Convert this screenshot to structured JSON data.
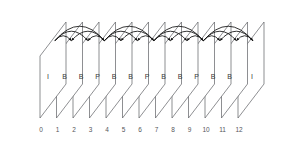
{
  "diagram": {
    "frame_count": 13,
    "frames": [
      {
        "index": "0",
        "type": "I"
      },
      {
        "index": "1",
        "type": "B"
      },
      {
        "index": "2",
        "type": "B"
      },
      {
        "index": "3",
        "type": "P"
      },
      {
        "index": "4",
        "type": "B"
      },
      {
        "index": "5",
        "type": "B"
      },
      {
        "index": "6",
        "type": "P"
      },
      {
        "index": "7",
        "type": "B"
      },
      {
        "index": "8",
        "type": "B"
      },
      {
        "index": "9",
        "type": "P"
      },
      {
        "index": "10",
        "type": "B"
      },
      {
        "index": "11",
        "type": "B"
      },
      {
        "index": "12",
        "type": "I"
      }
    ],
    "colors": {
      "plane_stroke": "#5d5f63",
      "arrow": "#101010",
      "frame_label": "#3a3a3a",
      "index_label": "#55565a",
      "background": "#ffffff"
    },
    "geometry": {
      "first_frame_x": 40,
      "frame_pitch": 16.5,
      "plane_width": 13,
      "plane_height": 62,
      "skew_x": 26,
      "skew_y": -34,
      "baseline_y": 118
    },
    "predictions": [
      {
        "from": "0",
        "to": "3",
        "tier": "tall",
        "direction": "forward"
      },
      {
        "from": "0",
        "to": "1",
        "tier": "low",
        "direction": "forward"
      },
      {
        "from": "0",
        "to": "2",
        "tier": "medium",
        "direction": "forward"
      },
      {
        "from": "3",
        "to": "2",
        "tier": "low",
        "direction": "backward"
      },
      {
        "from": "3",
        "to": "1",
        "tier": "medium",
        "direction": "backward"
      },
      {
        "from": "3",
        "to": "6",
        "tier": "tall",
        "direction": "forward"
      },
      {
        "from": "3",
        "to": "4",
        "tier": "low",
        "direction": "forward"
      },
      {
        "from": "3",
        "to": "5",
        "tier": "medium",
        "direction": "forward"
      },
      {
        "from": "6",
        "to": "5",
        "tier": "low",
        "direction": "backward"
      },
      {
        "from": "6",
        "to": "4",
        "tier": "medium",
        "direction": "backward"
      },
      {
        "from": "6",
        "to": "9",
        "tier": "tall",
        "direction": "forward"
      },
      {
        "from": "6",
        "to": "7",
        "tier": "low",
        "direction": "forward"
      },
      {
        "from": "6",
        "to": "8",
        "tier": "medium",
        "direction": "forward"
      },
      {
        "from": "9",
        "to": "8",
        "tier": "low",
        "direction": "backward"
      },
      {
        "from": "9",
        "to": "7",
        "tier": "medium",
        "direction": "backward"
      },
      {
        "from": "9",
        "to": "12",
        "tier": "tall",
        "direction": "forward"
      },
      {
        "from": "9",
        "to": "10",
        "tier": "low",
        "direction": "forward"
      },
      {
        "from": "9",
        "to": "11",
        "tier": "medium",
        "direction": "forward"
      },
      {
        "from": "12",
        "to": "11",
        "tier": "low",
        "direction": "backward"
      },
      {
        "from": "12",
        "to": "10",
        "tier": "medium",
        "direction": "backward"
      }
    ]
  }
}
